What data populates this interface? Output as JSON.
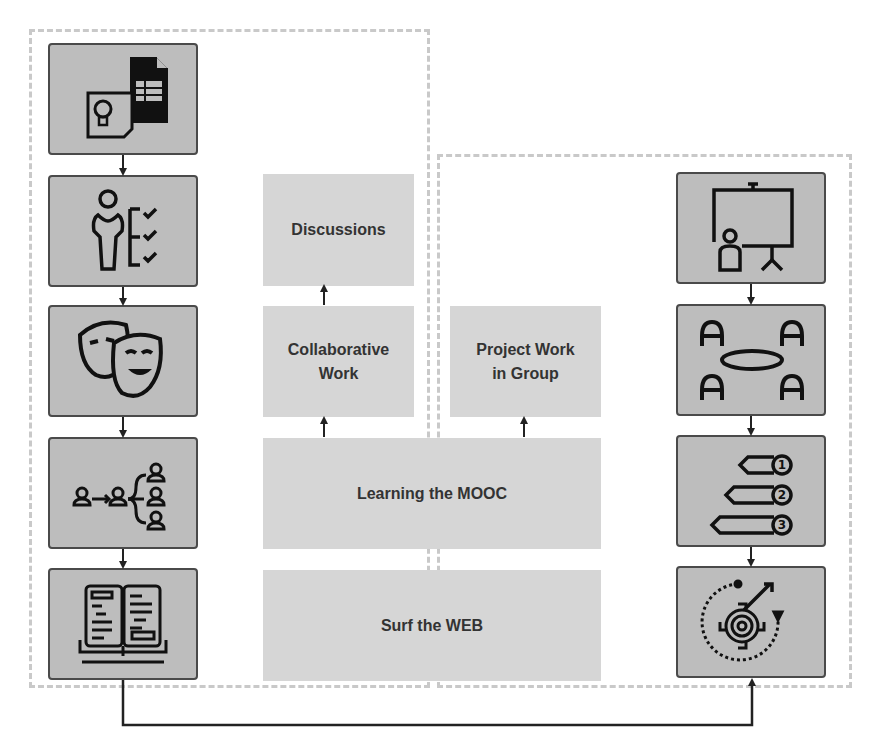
{
  "diagram": {
    "title": "",
    "colors": {
      "icon_box_fill": "#bdbdbd",
      "icon_box_border": "#4a4a4a",
      "label_box_fill": "#d6d6d6",
      "label_text": "#333333",
      "region_border": "#c9c9c9",
      "arrow": "#222222"
    },
    "left_column": {
      "icons": [
        {
          "name": "idea-document-icon"
        },
        {
          "name": "person-checklist-icon"
        },
        {
          "name": "theater-masks-icon"
        },
        {
          "name": "knowledge-sharing-network-icon"
        },
        {
          "name": "open-book-icon"
        }
      ]
    },
    "center_boxes": {
      "discussions": "Discussions",
      "collaborative_work": "Collaborative\nWork",
      "project_work": "Project Work\nin Group",
      "learning_mooc": "Learning the MOOC",
      "surf_web": "Surf the WEB"
    },
    "right_column": {
      "icons": [
        {
          "name": "presentation-board-icon"
        },
        {
          "name": "group-meeting-table-icon"
        },
        {
          "name": "numbered-steps-icon"
        },
        {
          "name": "gear-process-cycle-icon"
        }
      ]
    },
    "connectors": [
      "left-column-top-to-bottom",
      "right-column-top-to-bottom",
      "surf-web-to-learning-mooc (implicit)",
      "learning-mooc-to-collaborative-work",
      "learning-mooc-to-project-work",
      "collaborative-work-to-discussions",
      "open-book-to-gear-process (bottom loop)"
    ]
  }
}
